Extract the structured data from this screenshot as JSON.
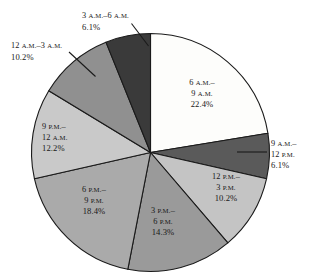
{
  "chart_data": {
    "type": "pie",
    "title": "",
    "subtitle": "",
    "xlabel": "",
    "ylabel": "",
    "legend_position": "none",
    "grid": false,
    "value_unit": "percent",
    "start_angle_deg": 0,
    "direction": "clockwise",
    "categories": [
      "6 A.M.-9 A.M.",
      "9 A.M.-12 P.M.",
      "12 P.M.-3 P.M.",
      "3 P.M.-6 P.M.",
      "6 P.M.-9 P.M.",
      "9 P.M.-12 A.M.",
      "12 A.M.-3 A.M.",
      "3 A.M.-6 A.M."
    ],
    "values": [
      22.4,
      6.1,
      10.2,
      14.3,
      18.4,
      12.2,
      10.2,
      6.1
    ],
    "labels": [
      "22.4%",
      "6.1%",
      "10.2%",
      "14.3%",
      "18.4%",
      "12.2%",
      "10.2%",
      "6.1%"
    ],
    "colors": [
      "#fdfdfb",
      "#5a5a5a",
      "#c4c4c4",
      "#9a9a9a",
      "#aaaaaa",
      "#c9c9c9",
      "#909090",
      "#3a3a3a"
    ],
    "slices": [
      {
        "name": "6am-9am",
        "line1_time": "6",
        "line1_meridiem": "A.M.",
        "line1_dash": "–",
        "line2_time": "9",
        "line2_meridiem": "A.M.",
        "percent": "22.4%",
        "value": 22.4,
        "color": "#fdfdfb",
        "label_placement": "inside",
        "text_color": "#181818"
      },
      {
        "name": "9am-12pm",
        "line1_time": "9",
        "line1_meridiem": "A.M.",
        "line1_dash": "–",
        "line2_time": "12",
        "line2_meridiem": "P.M.",
        "percent": "6.1%",
        "value": 6.1,
        "color": "#5a5a5a",
        "label_placement": "outside",
        "text_color": "#181818"
      },
      {
        "name": "12pm-3pm",
        "line1_time": "12",
        "line1_meridiem": "P.M.",
        "line1_dash": "–",
        "line2_time": "3",
        "line2_meridiem": "P.M.",
        "percent": "10.2%",
        "value": 10.2,
        "color": "#c4c4c4",
        "label_placement": "inside",
        "text_color": "#181818"
      },
      {
        "name": "3pm-6pm",
        "line1_time": "3",
        "line1_meridiem": "P.M.",
        "line1_dash": "–",
        "line2_time": "6",
        "line2_meridiem": "P.M.",
        "percent": "14.3%",
        "value": 14.3,
        "color": "#9a9a9a",
        "label_placement": "inside",
        "text_color": "#181818"
      },
      {
        "name": "6pm-9pm",
        "line1_time": "6",
        "line1_meridiem": "P.M.",
        "line1_dash": "–",
        "line2_time": "9",
        "line2_meridiem": "P.M.",
        "percent": "18.4%",
        "value": 18.4,
        "color": "#aaaaaa",
        "label_placement": "inside",
        "text_color": "#181818"
      },
      {
        "name": "9pm-12am",
        "line1_time": "9",
        "line1_meridiem": "P.M.",
        "line1_dash": "–",
        "line2_time": "12",
        "line2_meridiem": "A.M.",
        "percent": "12.2%",
        "value": 12.2,
        "color": "#c9c9c9",
        "label_placement": "inside",
        "text_color": "#181818"
      },
      {
        "name": "12am-3am",
        "line1_time": "12",
        "line1_meridiem": "A.M.",
        "line1_dash": "–",
        "line1_time_b": "3",
        "line1_meridiem_b": "A.M.",
        "percent": "10.2%",
        "value": 10.2,
        "color": "#909090",
        "label_placement": "outside",
        "text_color": "#181818"
      },
      {
        "name": "3am-6am",
        "line1_time": "3",
        "line1_meridiem": "A.M.",
        "line1_dash": "–",
        "line1_time_b": "6",
        "line1_meridiem_b": "A.M.",
        "percent": "6.1%",
        "value": 6.1,
        "color": "#3a3a3a",
        "label_placement": "outside",
        "text_color": "#181818"
      }
    ]
  },
  "pie_outline_color": "#1a1a1a",
  "background": "#ffffff"
}
